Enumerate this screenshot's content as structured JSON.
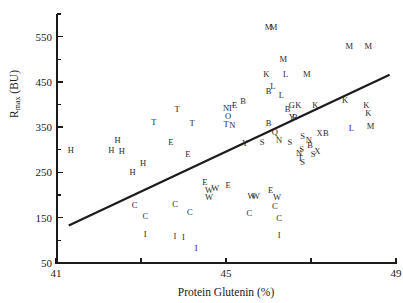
{
  "chart_data": {
    "type": "scatter",
    "title": "",
    "xlabel": "Protein Glutenin (%)",
    "ylabel": "Rmax (BU)",
    "ylabel_base": "R",
    "ylabel_sub": "max",
    "ylabel_unit": " (BU)",
    "xlim": [
      41,
      49
    ],
    "ylim": [
      50,
      600
    ],
    "grid": false,
    "legend": "none",
    "x_ticks": [
      41,
      43,
      45,
      47,
      49
    ],
    "x_tick_labels": [
      "41",
      "",
      "45",
      "",
      "49"
    ],
    "y_ticks_major": [
      50,
      150,
      250,
      350,
      450,
      550
    ],
    "y_ticks_minor": [
      100,
      200,
      300,
      400,
      500,
      600
    ],
    "y_tick_labels": [
      "50",
      "150",
      "250",
      "350",
      "450",
      "550"
    ],
    "marker_style": "letter-coded genotype label",
    "trend_line": {
      "label": "regression line",
      "x1": 41.3,
      "y1": 133,
      "x2": 48.85,
      "y2": 466
    },
    "points": [
      {
        "label": "H",
        "x": 41.35,
        "y": 300
      },
      {
        "label": "H",
        "x": 42.3,
        "y": 300
      },
      {
        "label": "H",
        "x": 42.55,
        "y": 298
      },
      {
        "label": "H",
        "x": 42.45,
        "y": 322
      },
      {
        "label": "H",
        "x": 43.05,
        "y": 270
      },
      {
        "label": "H",
        "x": 42.8,
        "y": 252
      },
      {
        "label": "C",
        "x": 42.85,
        "y": 178
      },
      {
        "label": "C",
        "x": 43.1,
        "y": 153
      },
      {
        "label": "I",
        "x": 43.1,
        "y": 114
      },
      {
        "label": "C",
        "x": 43.8,
        "y": 180
      },
      {
        "label": "I",
        "x": 43.8,
        "y": 110
      },
      {
        "label": "I",
        "x": 44.0,
        "y": 108
      },
      {
        "label": "I",
        "x": 44.3,
        "y": 84
      },
      {
        "label": "C",
        "x": 44.15,
        "y": 162
      },
      {
        "label": "T",
        "x": 43.3,
        "y": 362
      },
      {
        "label": "T",
        "x": 43.85,
        "y": 390
      },
      {
        "label": "T",
        "x": 44.2,
        "y": 360
      },
      {
        "label": "E",
        "x": 43.7,
        "y": 318
      },
      {
        "label": "E",
        "x": 44.1,
        "y": 290
      },
      {
        "label": "E",
        "x": 44.5,
        "y": 228
      },
      {
        "label": "W",
        "x": 44.6,
        "y": 212
      },
      {
        "label": "W",
        "x": 44.75,
        "y": 215
      },
      {
        "label": "W",
        "x": 44.6,
        "y": 196
      },
      {
        "label": "E",
        "x": 45.05,
        "y": 222
      },
      {
        "label": "W",
        "x": 45.6,
        "y": 198
      },
      {
        "label": "W",
        "x": 45.7,
        "y": 198
      },
      {
        "label": "E",
        "x": 46.05,
        "y": 212
      },
      {
        "label": "W",
        "x": 46.2,
        "y": 196
      },
      {
        "label": "C",
        "x": 45.55,
        "y": 160
      },
      {
        "label": "C",
        "x": 46.15,
        "y": 176
      },
      {
        "label": "C",
        "x": 46.25,
        "y": 150
      },
      {
        "label": "I",
        "x": 46.25,
        "y": 112
      },
      {
        "label": "T",
        "x": 45.1,
        "y": 392
      },
      {
        "label": "N",
        "x": 45.0,
        "y": 392
      },
      {
        "label": "O",
        "x": 45.05,
        "y": 374
      },
      {
        "label": "T",
        "x": 45.0,
        "y": 358
      },
      {
        "label": "N",
        "x": 45.15,
        "y": 354
      },
      {
        "label": "Y",
        "x": 45.45,
        "y": 316
      },
      {
        "label": "S",
        "x": 45.85,
        "y": 318
      },
      {
        "label": "B",
        "x": 46.0,
        "y": 430
      },
      {
        "label": "L",
        "x": 46.4,
        "y": 468
      },
      {
        "label": "B",
        "x": 46.45,
        "y": 390
      },
      {
        "label": "Q",
        "x": 46.15,
        "y": 340
      },
      {
        "label": "N",
        "x": 46.25,
        "y": 322
      },
      {
        "label": "S",
        "x": 46.5,
        "y": 318
      },
      {
        "label": "Y",
        "x": 46.55,
        "y": 372
      },
      {
        "label": "B",
        "x": 46.62,
        "y": 372
      },
      {
        "label": "S",
        "x": 46.8,
        "y": 330
      },
      {
        "label": "N",
        "x": 46.95,
        "y": 322
      },
      {
        "label": "B",
        "x": 46.98,
        "y": 310
      },
      {
        "label": "S",
        "x": 46.78,
        "y": 302
      },
      {
        "label": "N",
        "x": 46.72,
        "y": 294
      },
      {
        "label": "T",
        "x": 46.75,
        "y": 282
      },
      {
        "label": "S",
        "x": 46.8,
        "y": 272
      },
      {
        "label": "S",
        "x": 47.05,
        "y": 290
      },
      {
        "label": "X",
        "x": 47.15,
        "y": 298
      },
      {
        "label": "X",
        "x": 47.2,
        "y": 338
      },
      {
        "label": "B",
        "x": 47.35,
        "y": 338
      },
      {
        "label": "G",
        "x": 46.55,
        "y": 398
      },
      {
        "label": "L",
        "x": 46.3,
        "y": 420
      },
      {
        "label": "B",
        "x": 46.0,
        "y": 360
      },
      {
        "label": "K",
        "x": 45.95,
        "y": 468
      },
      {
        "label": "L",
        "x": 46.1,
        "y": 440
      },
      {
        "label": "K",
        "x": 46.7,
        "y": 398
      },
      {
        "label": "K",
        "x": 47.1,
        "y": 400
      },
      {
        "label": "M",
        "x": 46.35,
        "y": 500
      },
      {
        "label": "M",
        "x": 46.9,
        "y": 468
      },
      {
        "label": "M",
        "x": 46.0,
        "y": 572
      },
      {
        "label": "M",
        "x": 46.12,
        "y": 572
      },
      {
        "label": "M",
        "x": 47.9,
        "y": 530
      },
      {
        "label": "M",
        "x": 48.35,
        "y": 530
      },
      {
        "label": "K",
        "x": 47.8,
        "y": 410
      },
      {
        "label": "K",
        "x": 48.3,
        "y": 398
      },
      {
        "label": "K",
        "x": 48.35,
        "y": 382
      },
      {
        "label": "L",
        "x": 47.95,
        "y": 348
      },
      {
        "label": "M",
        "x": 48.4,
        "y": 352
      },
      {
        "label": "E",
        "x": 45.2,
        "y": 398
      },
      {
        "label": "B",
        "x": 45.4,
        "y": 408
      }
    ]
  }
}
